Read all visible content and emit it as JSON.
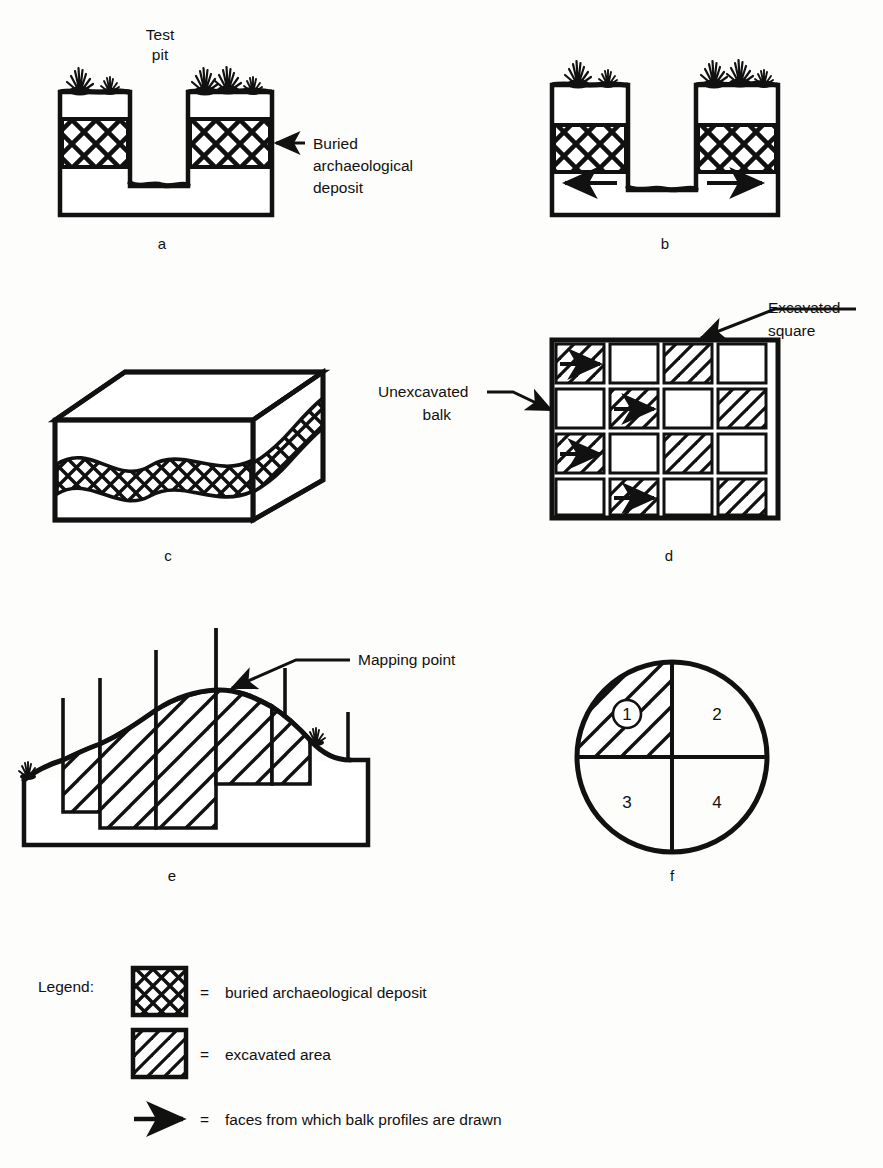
{
  "figure": {
    "title_absent": true,
    "background_color": "#fdfdfb",
    "ink_color": "#111111"
  },
  "panels": [
    {
      "id": "a",
      "letter": "a",
      "caption_label": "Test pit",
      "description": "Cross-section of buried deposit with a narrow test pit cut through it",
      "annotation": "Buried archaeological deposit"
    },
    {
      "id": "b",
      "letter": "b",
      "description": "Cross-section with a wider trench; arrows mark the balk faces profiled"
    },
    {
      "id": "c",
      "letter": "c",
      "description": "Three-dimensional block showing the buried deposit layer in section"
    },
    {
      "id": "d",
      "letter": "d",
      "description": "Plan of a four-by-four grid of excavation squares separated by balks",
      "annotations": [
        "Excavated square",
        "Unexcavated balk"
      ]
    },
    {
      "id": "e",
      "letter": "e",
      "description": "Profile of a mound with stepped excavation units and mapping stakes",
      "annotation": "Mapping point"
    },
    {
      "id": "f",
      "letter": "f",
      "description": "Circular site plan divided into four numbered quadrants",
      "quadrants": [
        "1",
        "2",
        "3",
        "4"
      ],
      "excavated_quadrant": "1"
    }
  ],
  "labels": {
    "test_pit_line1": "Test",
    "test_pit_line2": "pit",
    "buried_line1": "Buried",
    "buried_line2": "archaeological",
    "buried_line3": "deposit",
    "excavated_square_line1": "Excavated",
    "excavated_square_line2": "square",
    "unexcavated_balk_line1": "Unexcavated",
    "unexcavated_balk_line2": "balk",
    "mapping_point": "Mapping point"
  },
  "panel_letters": {
    "a": "a",
    "b": "b",
    "c": "c",
    "d": "d",
    "e": "e",
    "f": "f"
  },
  "quadrant_numbers": {
    "q1": "1",
    "q2": "2",
    "q3": "3",
    "q4": "4"
  },
  "legend": {
    "heading": "Legend:",
    "equals": "=",
    "items": [
      {
        "swatch": "crosshatch-swatch",
        "equals": "=",
        "text": "buried archaeological deposit"
      },
      {
        "swatch": "diagonal-hatch-swatch",
        "equals": "=",
        "text": "excavated area"
      },
      {
        "swatch": "arrow-swatch",
        "equals": "=",
        "text": "faces from which balk profiles are drawn"
      }
    ]
  },
  "grid_d": {
    "rows": 4,
    "cols": 4,
    "hatched_cells": [
      [
        true,
        false,
        true,
        false
      ],
      [
        false,
        true,
        false,
        true
      ],
      [
        true,
        false,
        true,
        false
      ],
      [
        false,
        true,
        false,
        true
      ]
    ],
    "arrow_cells": [
      [
        true,
        false,
        false,
        false
      ],
      [
        false,
        true,
        false,
        false
      ],
      [
        true,
        false,
        false,
        false
      ],
      [
        false,
        true,
        false,
        false
      ]
    ]
  }
}
